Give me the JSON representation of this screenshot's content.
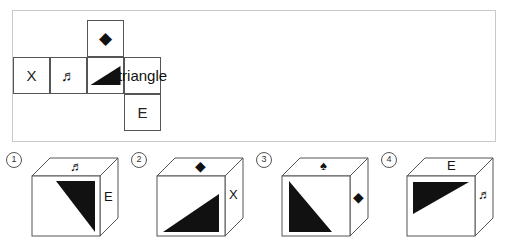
{
  "puzzle": {
    "type": "cube-net-folding",
    "net": {
      "description": "Unfolded cube net laid out in a plus/T arrangement",
      "cells": [
        {
          "id": "diamond",
          "symbol": "◆",
          "name": "diamond",
          "row": 0,
          "col": 2
        },
        {
          "id": "x",
          "symbol": "X",
          "name": "letter-x",
          "row": 1,
          "col": 0
        },
        {
          "id": "note",
          "symbol": "♬",
          "name": "music-note",
          "row": 1,
          "col": 1
        },
        {
          "id": "tri",
          "symbol": "triangle",
          "name": "right-triangle",
          "row": 1,
          "col": 2
        },
        {
          "id": "spade",
          "symbol": "♠",
          "name": "spade",
          "row": 1,
          "col": 3
        },
        {
          "id": "e",
          "symbol": "E",
          "name": "letter-e",
          "row": 2,
          "col": 3
        }
      ]
    },
    "options": [
      {
        "number": "①",
        "label": "1",
        "top_face": "♬",
        "top_face_name": "music-note",
        "front_face": "triangle",
        "front_face_name": "right-triangle",
        "right_face": "E",
        "right_face_name": "letter-e"
      },
      {
        "number": "②",
        "label": "2",
        "top_face": "◆",
        "top_face_name": "diamond",
        "front_face": "triangle",
        "front_face_name": "right-triangle",
        "right_face": "X",
        "right_face_name": "letter-x"
      },
      {
        "number": "③",
        "label": "3",
        "top_face": "♠",
        "top_face_name": "spade",
        "front_face": "triangle",
        "front_face_name": "right-triangle",
        "right_face": "◆",
        "right_face_name": "diamond"
      },
      {
        "number": "④",
        "label": "4",
        "top_face": "E",
        "top_face_name": "letter-e",
        "front_face": "triangle",
        "front_face_name": "right-triangle",
        "right_face": "♬",
        "right_face_name": "music-note"
      }
    ]
  },
  "colors": {
    "fill": "#111111",
    "stroke": "#555555",
    "frame": "#c9c9c9",
    "background": "#ffffff"
  }
}
